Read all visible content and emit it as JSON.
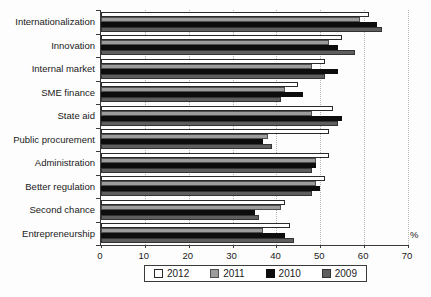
{
  "chart_data": {
    "type": "bar",
    "orientation": "horizontal",
    "title": "",
    "xlabel": "%",
    "ylabel": "",
    "xlim": [
      0,
      70
    ],
    "x_ticks": [
      0,
      10,
      20,
      30,
      40,
      50,
      60,
      70
    ],
    "grid": "dotted-vertical",
    "legend_position": "bottom-boxed",
    "categories": [
      "Internationalization",
      "Innovation",
      "Internal market",
      "SME finance",
      "State aid",
      "Public procurement",
      "Administration",
      "Better regulation",
      "Second chance",
      "Entrepreneurship"
    ],
    "series": [
      {
        "name": "2012",
        "color": "#ffffff",
        "border": "#2a2a2a",
        "values": [
          61,
          55,
          51,
          45,
          53,
          52,
          52,
          51,
          42,
          43
        ]
      },
      {
        "name": "2011",
        "color": "#9c9c9c",
        "border": "#4f4f4f",
        "values": [
          59,
          52,
          48,
          42,
          48,
          38,
          49,
          49,
          41,
          37
        ]
      },
      {
        "name": "2010",
        "color": "#0d0d0d",
        "border": "#0d0d0d",
        "values": [
          63,
          54,
          54,
          46,
          55,
          37,
          49,
          50,
          35,
          42
        ]
      },
      {
        "name": "2009",
        "color": "#5e5e5e",
        "border": "#333333",
        "values": [
          64,
          58,
          51,
          41,
          54,
          39,
          48,
          48,
          36,
          44
        ]
      }
    ]
  }
}
